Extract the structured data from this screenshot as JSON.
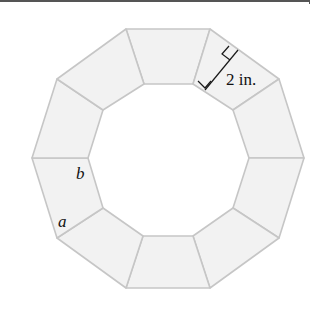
{
  "figure": {
    "shape": "decagonal ring of 10 congruent trapezoids",
    "tile_count": 10,
    "colors": {
      "tile_fill": "#f2f2f2",
      "tile_stroke": "#c6c6c6",
      "annotation": "#1a1a1a"
    }
  },
  "labels": {
    "height": "2 in.",
    "side_b": "b",
    "side_a": "a"
  }
}
